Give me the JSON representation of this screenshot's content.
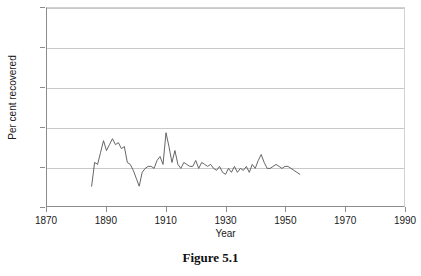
{
  "caption": "Figure 5.1",
  "chart_data": {
    "type": "line",
    "title": "",
    "xlabel": "Year",
    "ylabel": "Per cent recovered",
    "xlim": [
      1870,
      1990
    ],
    "ylim": [
      0,
      100
    ],
    "xticks": [
      1870,
      1890,
      1910,
      1930,
      1950,
      1970,
      1990
    ],
    "yticks": [
      0,
      20,
      40,
      60,
      80,
      100
    ],
    "grid": "horizontal",
    "legend": "none",
    "line_color": "#555555",
    "grid_color": "#c9c9c9",
    "axis_color": "#8c8c8c",
    "x": [
      1885,
      1886,
      1887,
      1888,
      1889,
      1890,
      1891,
      1892,
      1893,
      1894,
      1895,
      1896,
      1897,
      1898,
      1899,
      1900,
      1901,
      1902,
      1903,
      1904,
      1905,
      1906,
      1907,
      1908,
      1909,
      1910,
      1911,
      1912,
      1913,
      1914,
      1915,
      1916,
      1917,
      1918,
      1919,
      1920,
      1921,
      1922,
      1923,
      1924,
      1925,
      1926,
      1927,
      1928,
      1929,
      1930,
      1931,
      1932,
      1933,
      1934,
      1935,
      1936,
      1937,
      1938,
      1939,
      1940,
      1941,
      1942,
      1943,
      1944,
      1945,
      1946,
      1947,
      1948,
      1949,
      1950,
      1951,
      1952,
      1953,
      1954,
      1955
    ],
    "values": [
      10,
      22,
      21,
      27,
      33,
      28,
      31,
      34,
      31,
      32,
      29,
      30,
      22,
      21,
      18,
      14,
      10,
      17,
      19,
      20,
      20,
      19,
      23,
      25,
      21,
      37,
      30,
      22,
      28,
      21,
      19,
      22,
      21,
      20,
      20,
      23,
      19,
      22,
      21,
      20,
      21,
      19,
      18,
      20,
      17,
      16,
      19,
      17,
      20,
      17,
      19,
      18,
      20,
      17,
      21,
      19,
      23,
      26,
      22,
      19,
      19,
      20,
      21,
      20,
      19,
      20,
      20,
      19,
      18,
      17,
      16
    ]
  }
}
